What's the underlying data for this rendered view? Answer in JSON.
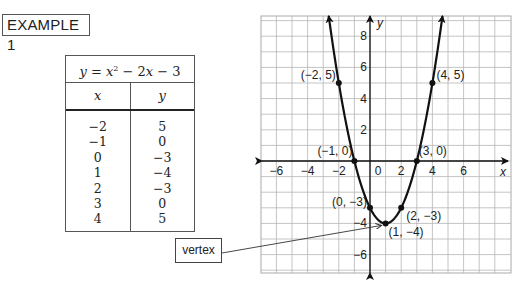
{
  "header": {
    "example_label": "EXAMPLE 1"
  },
  "table": {
    "title_parts": {
      "y": "y",
      "eq": " = ",
      "x1": "x",
      "exp": "2",
      "minus1": " − 2",
      "x2": "x",
      "minus2": " − 3"
    },
    "headers": [
      "x",
      "y"
    ],
    "x_values": [
      "−2",
      "−1",
      "0",
      "1",
      "2",
      "3",
      "4"
    ],
    "y_values": [
      "5",
      "0",
      "−3",
      "−4",
      "−3",
      "0",
      "5"
    ]
  },
  "callout": {
    "label": "vertex"
  },
  "chart_data": {
    "type": "line",
    "equation": {
      "a": 1,
      "b": -2,
      "c": -3
    },
    "xlabel": "x",
    "ylabel": "y",
    "xlim": [
      -7,
      9
    ],
    "ylim": [
      -7.2,
      9.3
    ],
    "grid": true,
    "x_ticks": [
      -6,
      -4,
      -2,
      0,
      2,
      4,
      6
    ],
    "x_tick_labels": [
      "−6",
      "−4",
      "−2",
      "0",
      "2",
      "4",
      "6"
    ],
    "y_ticks": [
      8,
      6,
      4,
      2,
      -4,
      -6
    ],
    "y_tick_labels": [
      "8",
      "6",
      "4",
      "2",
      "−4",
      "−6"
    ],
    "points": [
      {
        "x": -2,
        "y": 5,
        "label": "(−2, 5)",
        "pos": "left"
      },
      {
        "x": -1,
        "y": 0,
        "label": "(−1, 0)",
        "pos": "upper-left"
      },
      {
        "x": 0,
        "y": -3,
        "label": "(0, −3)",
        "pos": "left"
      },
      {
        "x": 1,
        "y": -4,
        "label": "(1, −4)",
        "pos": "below-right"
      },
      {
        "x": 2,
        "y": -3,
        "label": "(2, −3)",
        "pos": "below-right"
      },
      {
        "x": 3,
        "y": 0,
        "label": "(3, 0)",
        "pos": "upper-right"
      },
      {
        "x": 4,
        "y": 5,
        "label": "(4, 5)",
        "pos": "right"
      }
    ],
    "annotation": {
      "text": "vertex",
      "points_to": [
        1,
        -4
      ]
    }
  }
}
